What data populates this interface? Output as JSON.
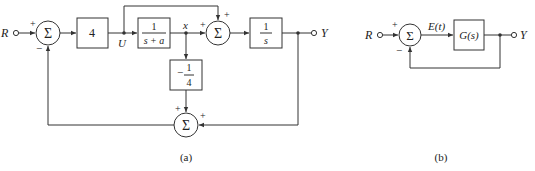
{
  "diagram_a": {
    "caption": "(a)",
    "input_label": "R",
    "output_label": "Y",
    "signal_u": "U",
    "signal_x": "x",
    "sum1": {
      "symbol": "Σ",
      "signs": [
        "+",
        "−"
      ]
    },
    "sum2": {
      "symbol": "Σ",
      "signs": [
        "+",
        "+"
      ]
    },
    "sum3": {
      "symbol": "Σ",
      "signs": [
        "+",
        "+"
      ]
    },
    "gain_block": "4",
    "plant_block": {
      "num": "1",
      "den": "s + a"
    },
    "integrator_block": {
      "num": "1",
      "den": "s"
    },
    "feedback_block": {
      "sign": "−",
      "num": "1",
      "den": "4"
    }
  },
  "diagram_b": {
    "caption": "(b)",
    "input_label": "R",
    "output_label": "Y",
    "error_label": "E(t)",
    "sum": {
      "symbol": "Σ",
      "signs": [
        "+",
        "−"
      ]
    },
    "block": "G(s)"
  }
}
